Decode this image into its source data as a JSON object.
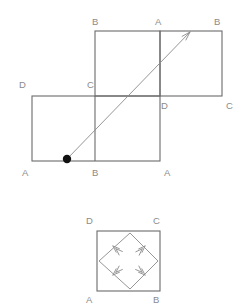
{
  "figure": {
    "background_color": "#ffffff",
    "line_color": "#6b6b6b",
    "ray_color": "#8a8a8a",
    "label_color": "#8b8b8b",
    "dot_color": "#111111"
  },
  "top_diagram": {
    "name": "net-with-ray",
    "squares": [
      {
        "name": "top-square",
        "x": 95,
        "y": 31,
        "w": 65,
        "h": 65
      },
      {
        "name": "right-square",
        "x": 160,
        "y": 31,
        "w": 62,
        "h": 65
      },
      {
        "name": "bottom-left-square",
        "x": 32,
        "y": 96,
        "w": 128,
        "h": 65
      }
    ],
    "labels": [
      {
        "name": "label-top-b-left",
        "text": "B",
        "x": 92,
        "y": 25
      },
      {
        "name": "label-top-a",
        "text": "A",
        "x": 155,
        "y": 25
      },
      {
        "name": "label-top-b-right",
        "text": "B",
        "x": 214,
        "y": 25
      },
      {
        "name": "label-mid-d-left",
        "text": "D",
        "x": 19,
        "y": 88
      },
      {
        "name": "label-mid-c",
        "text": "C",
        "x": 87,
        "y": 88
      },
      {
        "name": "label-mid-d-right",
        "text": "D",
        "x": 161,
        "y": 109
      },
      {
        "name": "label-mid-c-right",
        "text": "C",
        "x": 226,
        "y": 109
      },
      {
        "name": "label-bottom-a-left",
        "text": "A",
        "x": 22,
        "y": 176
      },
      {
        "name": "label-bottom-b",
        "text": "B",
        "x": 92,
        "y": 176
      },
      {
        "name": "label-bottom-a-right",
        "text": "A",
        "x": 164,
        "y": 176
      }
    ],
    "ray": {
      "name": "light-ray",
      "start": {
        "x": 67,
        "y": 159
      },
      "end": {
        "x": 190,
        "y": 32
      },
      "start_dot_radius": 4.2,
      "arrow_length": 9,
      "arrow_spread_deg": 17
    }
  },
  "bottom_diagram": {
    "name": "inscribed-square-path",
    "square": {
      "name": "outer-square",
      "x": 97,
      "y": 231,
      "w": 63,
      "h": 60
    },
    "diamond": {
      "name": "inner-diamond",
      "vertices": [
        {
          "name": "diamond-top",
          "x": 130,
          "y": 233
        },
        {
          "name": "diamond-right",
          "x": 158,
          "y": 261
        },
        {
          "name": "diamond-bottom",
          "x": 130,
          "y": 289
        },
        {
          "name": "diamond-left",
          "x": 99,
          "y": 261
        }
      ],
      "direction": "counterclockwise",
      "arrow_markers": [
        {
          "name": "arrow-top-to-left",
          "x": 113,
          "y": 246,
          "angle_deg": 223
        },
        {
          "name": "arrow-left-to-bottom",
          "x": 113,
          "y": 275,
          "angle_deg": 137
        },
        {
          "name": "arrow-bottom-to-right",
          "x": 145,
          "y": 275,
          "angle_deg": 43
        },
        {
          "name": "arrow-right-to-top",
          "x": 145,
          "y": 246,
          "angle_deg": 315
        }
      ]
    },
    "labels": [
      {
        "name": "label-bottom-fig-d",
        "text": "D",
        "x": 86,
        "y": 224
      },
      {
        "name": "label-bottom-fig-c",
        "text": "C",
        "x": 153,
        "y": 224
      },
      {
        "name": "label-bottom-fig-a",
        "text": "A",
        "x": 86,
        "y": 303
      },
      {
        "name": "label-bottom-fig-b",
        "text": "B",
        "x": 153,
        "y": 303
      }
    ]
  }
}
